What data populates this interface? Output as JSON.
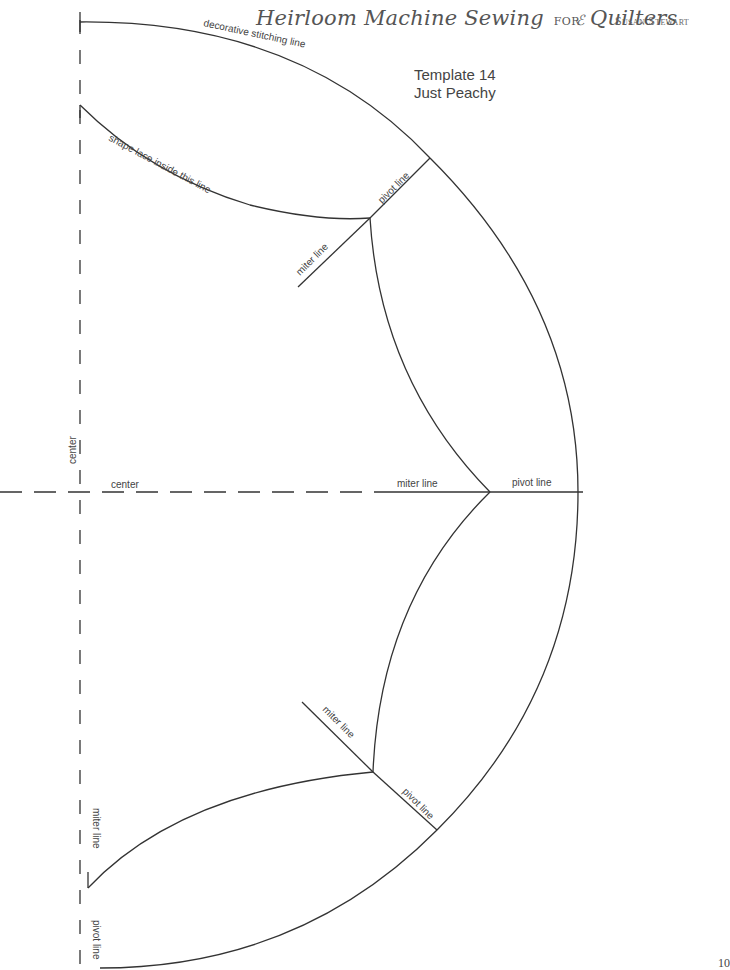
{
  "header": {
    "book_title_part1": "Heirloom Machine Sewing",
    "book_title_for": "for",
    "book_title_part2": "Quilters",
    "flourish": "ℰ",
    "author": "Susan Stewart"
  },
  "template": {
    "number_label": "Template 14",
    "name": "Just Peachy"
  },
  "labels": {
    "decorative_stitching_line": "decorative stitching line",
    "shape_lace_inside": "shape lace inside this line",
    "pivot_line_top": "pivot line",
    "miter_line_top": "miter line",
    "center_vertical": "center",
    "center_horizontal": "center",
    "miter_line_middle": "miter line",
    "pivot_line_middle": "pivot line",
    "miter_line_bottom": "miter line",
    "pivot_line_bottom": "pivot line",
    "miter_line_left": "miter line",
    "pivot_line_left": "pivot line"
  },
  "page_number": "10",
  "colors": {
    "line": "#333333",
    "text": "#444444",
    "header_text": "#555555"
  }
}
